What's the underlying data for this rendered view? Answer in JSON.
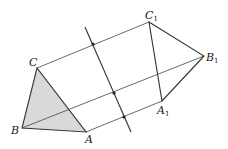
{
  "diagram": {
    "colors": {
      "shaded_fill": "#d9d9d9",
      "stroke": "#333333",
      "background": "#ffffff"
    },
    "points": {
      "A": {
        "label": "A",
        "x": 86,
        "y": 132
      },
      "B": {
        "label": "B",
        "x": 22,
        "y": 128
      },
      "C": {
        "label": "C",
        "x": 37,
        "y": 68
      },
      "A1": {
        "label": "A",
        "sub": "1",
        "x": 162,
        "y": 101
      },
      "B1": {
        "label": "B",
        "sub": "1",
        "x": 204,
        "y": 56
      },
      "C1": {
        "label": "C",
        "sub": "1",
        "x": 149,
        "y": 22
      }
    },
    "axis": {
      "x1": 85,
      "y1": 27,
      "x2": 131,
      "y2": 132
    },
    "midpoints": [
      {
        "x": 93,
        "y": 44
      },
      {
        "x": 114,
        "y": 93
      },
      {
        "x": 124,
        "y": 117
      }
    ]
  }
}
